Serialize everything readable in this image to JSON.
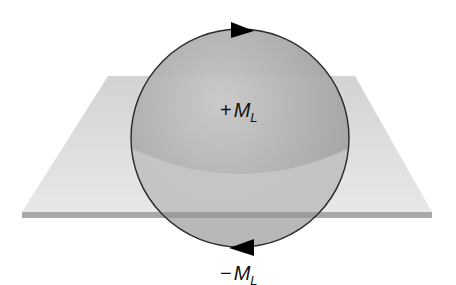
{
  "diagram": {
    "colors": {
      "background": "#ffffff",
      "plane_top": "#dcdcdc",
      "plane_edge": "#a9a9a9",
      "sphere_upper": "#a8a8a8",
      "sphere_lower": "#c4c4c4",
      "outline": "#2a2a2a",
      "arrow": "#000000"
    },
    "labels": {
      "upper": {
        "sign": "+",
        "symbol": "M",
        "subscript": "L"
      },
      "lower": {
        "sign": "−",
        "symbol": "M",
        "subscript": "L"
      }
    },
    "arrows": {
      "top": "right",
      "bottom": "left"
    }
  }
}
